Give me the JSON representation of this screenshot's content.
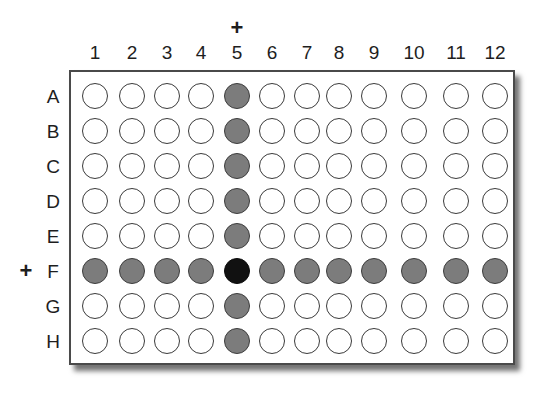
{
  "plate": {
    "columns": [
      "1",
      "2",
      "3",
      "4",
      "5",
      "6",
      "7",
      "8",
      "9",
      "10",
      "11",
      "12"
    ],
    "rows": [
      "A",
      "B",
      "C",
      "D",
      "E",
      "F",
      "G",
      "H"
    ],
    "column_marker": {
      "symbol": "+",
      "column": "5"
    },
    "row_marker": {
      "symbol": "+",
      "row": "F"
    },
    "highlighted_column": "5",
    "highlighted_row": "F",
    "intersection_well": "F5",
    "colors": {
      "empty": "#ffffff",
      "filled": "#7c7c7c",
      "intersection": "#111111",
      "outline": "#3a3a3a"
    }
  }
}
